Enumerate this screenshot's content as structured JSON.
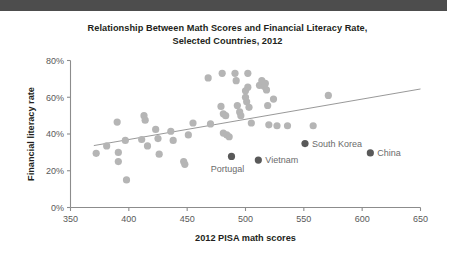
{
  "chart_data": {
    "type": "scatter",
    "title": "Relationship Between Math Scores and Financial Literacy Rate, Selected Countries, 2012",
    "title_line1": "Relationship Between Math Scores and Financial Literacy Rate,",
    "title_line2": "Selected Countries, 2012",
    "xlabel": "2012 PISA math scores",
    "ylabel": "Financial literacy rate",
    "xlim": [
      350,
      650
    ],
    "ylim": [
      0,
      0.8
    ],
    "xticks": [
      350,
      400,
      450,
      500,
      550,
      600,
      650
    ],
    "xtick_labels": [
      "350",
      "400",
      "450",
      "500",
      "550",
      "600",
      "650"
    ],
    "yticks": [
      0,
      0.2,
      0.4,
      0.6,
      0.8
    ],
    "ytick_labels": [
      "0%",
      "20%",
      "40%",
      "60%",
      "80%"
    ],
    "grid": false,
    "legend": null,
    "colors": {
      "point": "#b5b5b5",
      "highlight": "#595959",
      "trendline": "#8c8c8c",
      "axis": "#8c8c8c",
      "title": "#231f20",
      "top_bar": "#4d4d4d"
    },
    "point_radius_px": 3.6,
    "series": [
      {
        "name": "Selected countries",
        "color": "#b5b5b5",
        "points": [
          {
            "x": 372,
            "y": 0.295
          },
          {
            "x": 381,
            "y": 0.335
          },
          {
            "x": 390,
            "y": 0.465
          },
          {
            "x": 391,
            "y": 0.3
          },
          {
            "x": 391,
            "y": 0.25
          },
          {
            "x": 397,
            "y": 0.365
          },
          {
            "x": 398,
            "y": 0.15
          },
          {
            "x": 411,
            "y": 0.37
          },
          {
            "x": 413,
            "y": 0.5
          },
          {
            "x": 414,
            "y": 0.475
          },
          {
            "x": 416,
            "y": 0.335
          },
          {
            "x": 423,
            "y": 0.425
          },
          {
            "x": 425,
            "y": 0.375
          },
          {
            "x": 426,
            "y": 0.29
          },
          {
            "x": 436,
            "y": 0.415
          },
          {
            "x": 438,
            "y": 0.365
          },
          {
            "x": 447,
            "y": 0.25
          },
          {
            "x": 448,
            "y": 0.235
          },
          {
            "x": 451,
            "y": 0.395
          },
          {
            "x": 455,
            "y": 0.46
          },
          {
            "x": 468,
            "y": 0.705
          },
          {
            "x": 470,
            "y": 0.455
          },
          {
            "x": 479,
            "y": 0.55
          },
          {
            "x": 480,
            "y": 0.73
          },
          {
            "x": 481,
            "y": 0.51
          },
          {
            "x": 481,
            "y": 0.405
          },
          {
            "x": 483,
            "y": 0.5
          },
          {
            "x": 484,
            "y": 0.395
          },
          {
            "x": 486,
            "y": 0.385
          },
          {
            "x": 491,
            "y": 0.73
          },
          {
            "x": 492,
            "y": 0.69
          },
          {
            "x": 493,
            "y": 0.555
          },
          {
            "x": 495,
            "y": 0.52
          },
          {
            "x": 496,
            "y": 0.5
          },
          {
            "x": 500,
            "y": 0.635
          },
          {
            "x": 500,
            "y": 0.6
          },
          {
            "x": 501,
            "y": 0.575
          },
          {
            "x": 502,
            "y": 0.73
          },
          {
            "x": 502,
            "y": 0.655
          },
          {
            "x": 503,
            "y": 0.545
          },
          {
            "x": 505,
            "y": 0.46
          },
          {
            "x": 512,
            "y": 0.665
          },
          {
            "x": 514,
            "y": 0.69
          },
          {
            "x": 516,
            "y": 0.66
          },
          {
            "x": 517,
            "y": 0.675
          },
          {
            "x": 518,
            "y": 0.64
          },
          {
            "x": 519,
            "y": 0.555
          },
          {
            "x": 520,
            "y": 0.45
          },
          {
            "x": 524,
            "y": 0.59
          },
          {
            "x": 527,
            "y": 0.445
          },
          {
            "x": 536,
            "y": 0.445
          },
          {
            "x": 558,
            "y": 0.445
          },
          {
            "x": 571,
            "y": 0.61
          }
        ]
      }
    ],
    "annotated_points": [
      {
        "label": "Portugal",
        "x": 488,
        "y": 0.278,
        "label_dx": -4,
        "label_dy": 16,
        "label_anchor": "middle"
      },
      {
        "label": "Vietnam",
        "x": 511,
        "y": 0.258,
        "label_dx": 7,
        "label_dy": 3,
        "label_anchor": "start"
      },
      {
        "label": "South Korea",
        "x": 551,
        "y": 0.348,
        "label_dx": 7,
        "label_dy": 3,
        "label_anchor": "start"
      },
      {
        "label": "China",
        "x": 607,
        "y": 0.297,
        "label_dx": 7,
        "label_dy": 3,
        "label_anchor": "start"
      }
    ],
    "trendline": {
      "x_start": 370,
      "y_start": 0.337,
      "x_end": 660,
      "y_end": 0.645
    }
  }
}
